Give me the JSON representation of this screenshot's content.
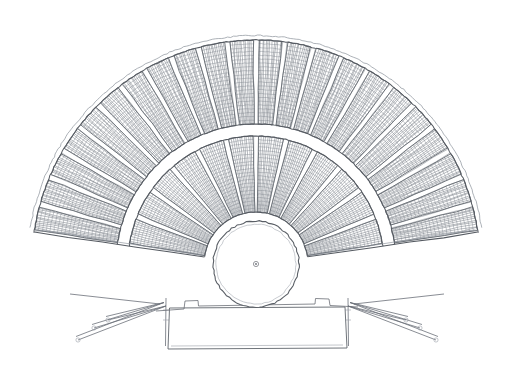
{
  "document": {
    "kind": "architectural-plan",
    "title": "Ancient Greek Theatre — Plan",
    "medium": "pencil / graphite line drawing on white paper",
    "canvas": {
      "width": 506,
      "height": 378,
      "background": "#ffffff"
    },
    "ink_color": "#6b6f76",
    "caption": ""
  },
  "geometry": {
    "center": {
      "x": 256,
      "y": 264
    },
    "orchestra_radius": 43,
    "inner_cavea_start_radius": 52,
    "diazoma_inner_radius": 128,
    "diazoma_outer_radius": 140,
    "outer_cavea_radius": 224,
    "start_angle_deg": 188,
    "end_angle_deg": 352,
    "sweep_deg": 164
  },
  "parts": {
    "orchestra": {
      "name": "orchestra",
      "label": "Orchestra (circular dancing floor)",
      "center_marker": "thymele-center-point",
      "radius": 43
    },
    "lower_cavea": {
      "name": "lower-cavea",
      "label": "Lower seating tier (kerkides)",
      "wedge_count": 12,
      "rows_per_wedge": 21,
      "stairway_count": 13
    },
    "upper_cavea": {
      "name": "upper-cavea",
      "label": "Upper seating tier (epitheatron)",
      "wedge_count": 22,
      "rows_per_wedge": 22,
      "stairway_count": 23
    },
    "diazoma": {
      "name": "diazoma",
      "label": "Diazoma (horizontal walkway)",
      "width": 12
    },
    "analemma": {
      "name": "analemma-wall",
      "label": "Analemma retaining walls",
      "count": 2
    },
    "skene": {
      "name": "skene",
      "label": "Skene (stage building)",
      "x": 168,
      "y": 307,
      "width": 178,
      "height": 42
    },
    "proskenion": {
      "name": "proskenion",
      "label": "Proskenion front wall"
    },
    "parodoi": {
      "name": "parodoi",
      "label": "Parodoi (side entrance ramps)",
      "count": 2,
      "rays_per_side": 3
    }
  },
  "chart_data": {
    "type": "table",
    "title": "Ancient Greek Theatre — Plan",
    "rows": [
      [
        "Orchestra radius",
        "43 px"
      ],
      [
        "Cavea outer radius",
        "224 px"
      ],
      [
        "Lower tier wedges",
        "12"
      ],
      [
        "Upper tier wedges",
        "22"
      ],
      [
        "Angular sweep",
        "164°"
      ]
    ]
  }
}
